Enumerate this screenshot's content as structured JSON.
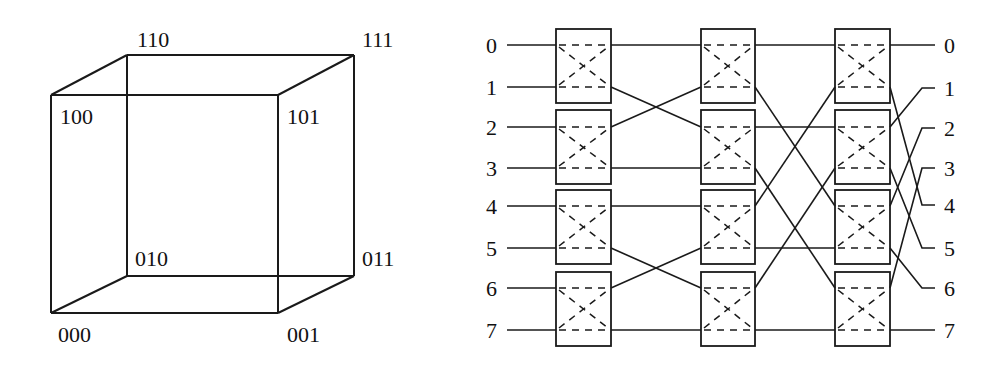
{
  "figure": {
    "left_panel": {
      "title": "3-dimensional hypercube",
      "vertices": [
        {
          "label": "000",
          "x": 51,
          "y": 313,
          "lx": 58,
          "ly": 342
        },
        {
          "label": "001",
          "x": 278,
          "y": 313,
          "lx": 287,
          "ly": 342
        },
        {
          "label": "010",
          "x": 127,
          "y": 276,
          "lx": 135,
          "ly": 266
        },
        {
          "label": "011",
          "x": 354,
          "y": 276,
          "lx": 362,
          "ly": 266
        },
        {
          "label": "100",
          "x": 51,
          "y": 95,
          "lx": 60,
          "ly": 124
        },
        {
          "label": "101",
          "x": 278,
          "y": 95,
          "lx": 287,
          "ly": 124
        },
        {
          "label": "110",
          "x": 127,
          "y": 55,
          "lx": 137,
          "ly": 47
        },
        {
          "label": "111",
          "x": 354,
          "y": 55,
          "lx": 362,
          "ly": 47
        }
      ]
    },
    "right_panel": {
      "title": "Omega / shuffle-exchange multistage network",
      "input_labels": [
        "0",
        "1",
        "2",
        "3",
        "4",
        "5",
        "6",
        "7"
      ],
      "output_labels": [
        "0",
        "1",
        "2",
        "3",
        "4",
        "5",
        "6",
        "7"
      ],
      "row_y": [
        45,
        87,
        127,
        168,
        206,
        248,
        288,
        330
      ],
      "output_label_y": [
        45,
        88,
        128,
        168,
        205,
        248,
        288,
        330
      ],
      "stages": [
        {
          "name": "stage-1",
          "x1": 556,
          "x2": 611
        },
        {
          "name": "stage-2",
          "x1": 701,
          "x2": 755
        },
        {
          "name": "stage-3",
          "x1": 835,
          "x2": 890
        }
      ],
      "box_rows": [
        [
          29,
          103
        ],
        [
          110,
          184
        ],
        [
          190,
          264
        ],
        [
          272,
          346
        ]
      ],
      "links_stage1_to_stage2": [
        0,
        2,
        1,
        3,
        4,
        6,
        5,
        7
      ],
      "links_stage2_to_stage3": [
        0,
        4,
        2,
        6,
        1,
        5,
        3,
        7
      ],
      "links_stage3_to_output": [
        0,
        4,
        1,
        5,
        2,
        6,
        3,
        7
      ]
    }
  }
}
